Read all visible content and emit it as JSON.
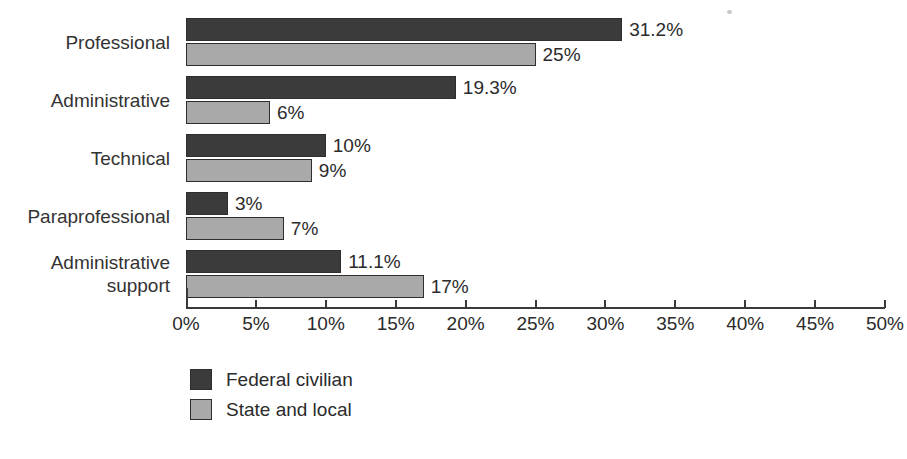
{
  "chart_data": {
    "type": "bar",
    "orientation": "horizontal",
    "title": "",
    "subtitle": "",
    "xlabel": "",
    "ylabel": "",
    "xlim": [
      0,
      50
    ],
    "x_tick_step": 5,
    "grid": false,
    "legend_position": "bottom-left",
    "value_suffix": "%",
    "categories": [
      "Professional",
      "Administrative",
      "Technical",
      "Paraprofessional",
      "Administrative support"
    ],
    "category_display": [
      "Professional",
      "Administrative",
      "Technical",
      "Paraprofessional",
      "Administrative\nsupport"
    ],
    "x_tick_labels": [
      "0%",
      "5%",
      "10%",
      "15%",
      "20%",
      "25%",
      "30%",
      "35%",
      "40%",
      "45%",
      "50%"
    ],
    "x_tick_values": [
      0,
      5,
      10,
      15,
      20,
      25,
      30,
      35,
      40,
      45,
      50
    ],
    "series": [
      {
        "name": "Federal civilian",
        "color": "#3b3b3b",
        "values": [
          31.2,
          19.3,
          10,
          3,
          11.1
        ],
        "value_labels": [
          "31.2%",
          "19.3%",
          "10%",
          "3%",
          "11.1%"
        ]
      },
      {
        "name": "State and local",
        "color": "#a9a9a9",
        "values": [
          25,
          6,
          9,
          7,
          17
        ],
        "value_labels": [
          "25%",
          "6%",
          "9%",
          "7%",
          "17%"
        ]
      }
    ]
  },
  "legend": {
    "items": [
      {
        "label": "Federal civilian",
        "color": "#3b3b3b"
      },
      {
        "label": "State and local",
        "color": "#a9a9a9"
      }
    ]
  },
  "colors": {
    "federal": "#3b3b3b",
    "state": "#a9a9a9",
    "axis": "#3a3a3a",
    "text": "#2b2b2b",
    "background": "#ffffff"
  }
}
